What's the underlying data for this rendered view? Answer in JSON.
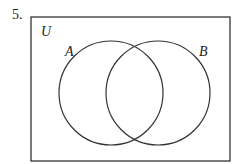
{
  "problem_number": "5.",
  "diagram": {
    "type": "venn",
    "universal_label": "U",
    "sets": [
      {
        "label": "A"
      },
      {
        "label": "B"
      }
    ],
    "stroke_color": "#333333"
  }
}
